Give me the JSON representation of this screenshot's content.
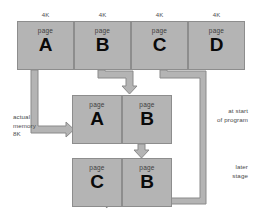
{
  "diagram": {
    "colors": {
      "box_fill": "#b4b4b4",
      "box_border": "#8d8d8d",
      "arrow_fill": "#b4b4b4",
      "arrow_border": "#8a8a8a",
      "text": "#4a4a4a",
      "letter": "#0a0a0a",
      "background": "#ffffff"
    },
    "size_labels": [
      {
        "text": "4K"
      },
      {
        "text": "4K"
      },
      {
        "text": "4K"
      },
      {
        "text": "4K"
      }
    ],
    "virtual_row": {
      "label": "virtual address space",
      "pages": [
        {
          "word": "page",
          "letter": "A"
        },
        {
          "word": "page",
          "letter": "B"
        },
        {
          "word": "page",
          "letter": "C"
        },
        {
          "word": "page",
          "letter": "D"
        }
      ]
    },
    "memory_row_start": {
      "label": "physical memory at start of program",
      "pages": [
        {
          "word": "page",
          "letter": "A"
        },
        {
          "word": "page",
          "letter": "B"
        }
      ]
    },
    "memory_row_later": {
      "label": "physical memory at later stage",
      "pages": [
        {
          "word": "page",
          "letter": "C"
        },
        {
          "word": "page",
          "letter": "B"
        }
      ]
    },
    "annotations": {
      "actual_memory": "actual\nmemory\n8K",
      "actual_memory_line1": "actual",
      "actual_memory_line2": "memory",
      "actual_memory_line3": "8K",
      "at_start_line1": "at start",
      "at_start_line2": "of program",
      "later_line1": "later",
      "later_line2": "stage"
    }
  }
}
